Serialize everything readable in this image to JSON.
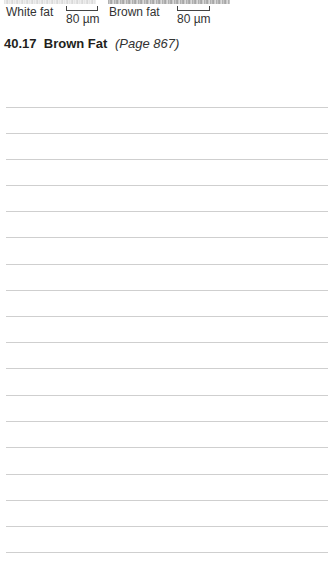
{
  "figure": {
    "panels": [
      {
        "label": "White fat",
        "scale_bar": "80 µm"
      },
      {
        "label": "Brown fat",
        "scale_bar": "80 µm"
      }
    ]
  },
  "section": {
    "number": "40.17",
    "title": "Brown Fat",
    "page_ref": "(Page 867)"
  },
  "notes": {
    "line_count": 18,
    "line_color": "#cfcfcf",
    "line_positions_y": [
      107,
      133,
      159,
      185,
      211,
      237,
      264,
      290,
      316,
      342,
      368,
      395,
      421,
      447,
      474,
      500,
      526,
      552
    ]
  }
}
